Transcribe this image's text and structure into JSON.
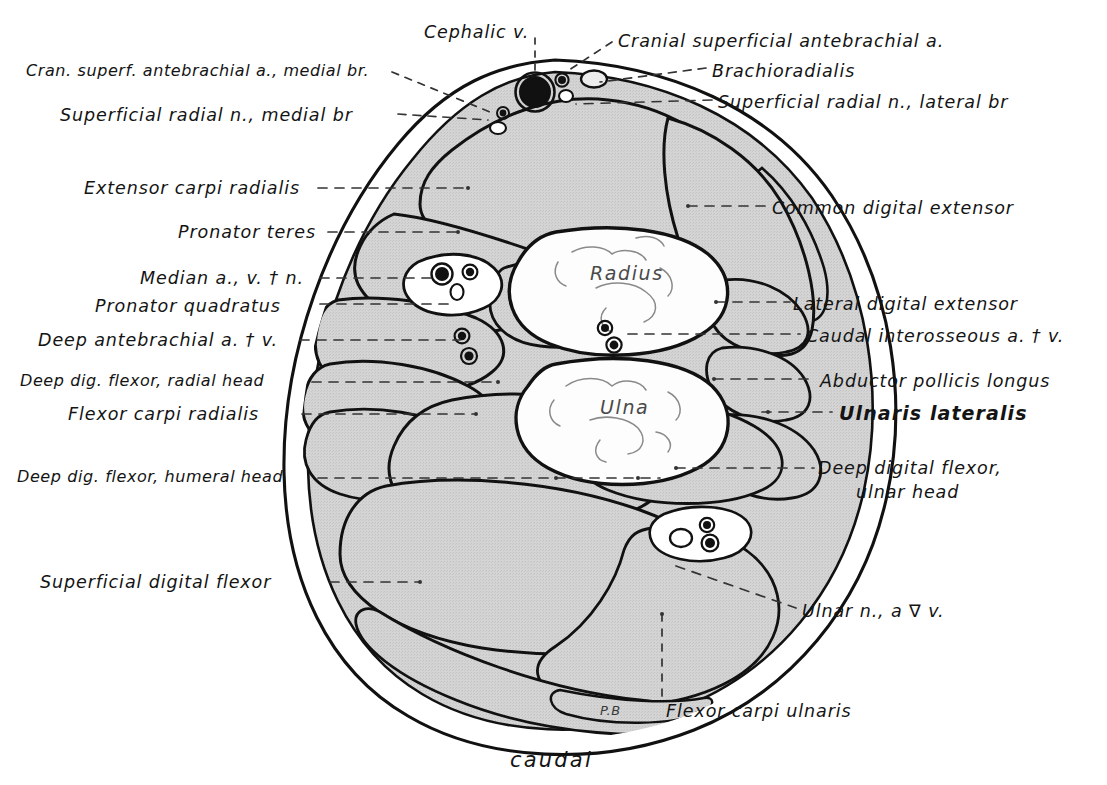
{
  "figure": {
    "title_orientation": "caudal",
    "signature": "P.B",
    "bones": [
      {
        "name": "Radius",
        "x": 590,
        "y": 272
      },
      {
        "name": "Ulna",
        "x": 598,
        "y": 404
      }
    ],
    "colors": {
      "background": "#ffffff",
      "muscle_fill": "#d2d2d2",
      "bone_fill": "#fcfcfc",
      "outline": "#111111",
      "vessel_dark": "#111111",
      "leader_line": "#333333"
    },
    "labels_left": [
      {
        "id": "cran-superf-antebrachial-medial",
        "text": "Cran. superf. antebrachial a., medial br.",
        "x": 26,
        "y": 62,
        "size": "sm"
      },
      {
        "id": "superficial-radial-medial",
        "text": "Superficial  radial n., medial br",
        "x": 60,
        "y": 105,
        "size": ""
      },
      {
        "id": "extensor-carpi-radialis",
        "text": "Extensor  carpi  radialis",
        "x": 84,
        "y": 178,
        "size": ""
      },
      {
        "id": "pronator-teres",
        "text": "Pronator  teres",
        "x": 178,
        "y": 222,
        "size": ""
      },
      {
        "id": "median-avn",
        "text": "Median  a., v. † n.",
        "x": 140,
        "y": 268,
        "size": ""
      },
      {
        "id": "pronator-quadratus",
        "text": "Pronator  quadratus",
        "x": 95,
        "y": 296,
        "size": ""
      },
      {
        "id": "deep-antebrachial-av",
        "text": "Deep antebrachial a. † v.",
        "x": 38,
        "y": 330,
        "size": ""
      },
      {
        "id": "deep-dig-flexor-radial-head",
        "text": "Deep dig. flexor, radial head",
        "x": 20,
        "y": 372,
        "size": "sm"
      },
      {
        "id": "flexor-carpi-radialis",
        "text": "Flexor carpi radialis",
        "x": 68,
        "y": 404,
        "size": ""
      },
      {
        "id": "deep-dig-flexor-humeral-head",
        "text": "Deep dig. flexor, humeral head",
        "x": 17,
        "y": 468,
        "size": "sm"
      },
      {
        "id": "superficial-digital-flexor",
        "text": "Superficial  digital flexor",
        "x": 40,
        "y": 572,
        "size": ""
      }
    ],
    "labels_right": [
      {
        "id": "cranial-superficial-antebrachial",
        "text": "Cranial superficial antebrachial a.",
        "x": 618,
        "y": 31,
        "size": ""
      },
      {
        "id": "brachioradialis",
        "text": "Brachioradialis",
        "x": 712,
        "y": 61,
        "size": ""
      },
      {
        "id": "superficial-radial-lateral",
        "text": "Superficial radial n., lateral  br",
        "x": 718,
        "y": 92,
        "size": ""
      },
      {
        "id": "common-digital-extensor",
        "text": "Common  digital  extensor",
        "x": 772,
        "y": 198,
        "size": ""
      },
      {
        "id": "lateral-digital-extensor",
        "text": "Lateral  digital  extensor",
        "x": 793,
        "y": 294,
        "size": ""
      },
      {
        "id": "caudal-interosseous-av",
        "text": "Caudal interosseous  a. † v.",
        "x": 806,
        "y": 326,
        "size": ""
      },
      {
        "id": "abductor-pollicis-longus",
        "text": "Abductor  pollicis  longus",
        "x": 820,
        "y": 371,
        "size": ""
      },
      {
        "id": "ulnaris-lateralis",
        "text": "Ulnaris lateralis",
        "x": 839,
        "y": 404,
        "size": "bold"
      },
      {
        "id": "ulnar-nav",
        "text": "Ulnar  n., a ∇ v.",
        "x": 802,
        "y": 601,
        "size": ""
      },
      {
        "id": "flexor-carpi-ulnaris",
        "text": "Flexor  carpi  ulnaris",
        "x": 666,
        "y": 701,
        "size": ""
      }
    ],
    "labels_top": [
      {
        "id": "cephalic-vein",
        "text": "Cephalic  v.",
        "x": 424,
        "y": 22,
        "size": ""
      }
    ],
    "vessels": [
      {
        "id": "cephalic-vein-lumen",
        "name": "cephalic vein"
      },
      {
        "id": "median-artery-vein-nerve-bundle",
        "name": "median a., v. & n."
      },
      {
        "id": "deep-antebrachial-bundle",
        "name": "deep antebrachial a. & v."
      },
      {
        "id": "caudal-interosseous-bundle",
        "name": "caudal interosseous a. & v."
      },
      {
        "id": "ulnar-bundle",
        "name": "ulnar n., a. & v."
      }
    ]
  }
}
